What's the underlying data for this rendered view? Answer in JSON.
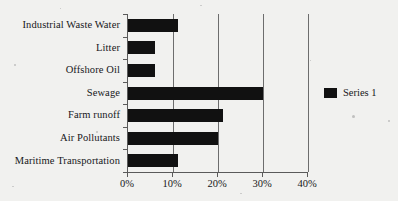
{
  "chart_data": {
    "type": "bar",
    "orientation": "horizontal",
    "title": "",
    "subtitle": "",
    "xlabel": "",
    "ylabel": "",
    "categories": [
      "Industrial Waste Water",
      "Litter",
      "Offshore Oil",
      "Sewage",
      "Farm runoff",
      "Air Pollutants",
      "Maritime Transportation"
    ],
    "series": [
      {
        "name": "Series 1",
        "color": "#111111",
        "values": [
          11,
          6,
          6,
          30,
          21,
          20,
          11
        ]
      }
    ],
    "values": [
      11,
      6,
      6,
      30,
      21,
      20,
      11
    ],
    "value_unit": "%",
    "xlim": [
      0,
      40
    ],
    "xticks": [
      0,
      10,
      20,
      30,
      40
    ],
    "xtick_labels": [
      "0%",
      "10%",
      "20%",
      "30%",
      "40%"
    ],
    "grid": "vertical",
    "gridlines_at": [
      10,
      20,
      30,
      40
    ],
    "legend_position": "right"
  },
  "legend": {
    "entries": [
      {
        "label": "Series 1",
        "color": "#111111"
      }
    ]
  },
  "colors": {
    "bar": "#111111",
    "axis": "#5a5a5a",
    "grid": "#6d6d6d",
    "text": "#17171a",
    "background": "#f1f1ef"
  }
}
